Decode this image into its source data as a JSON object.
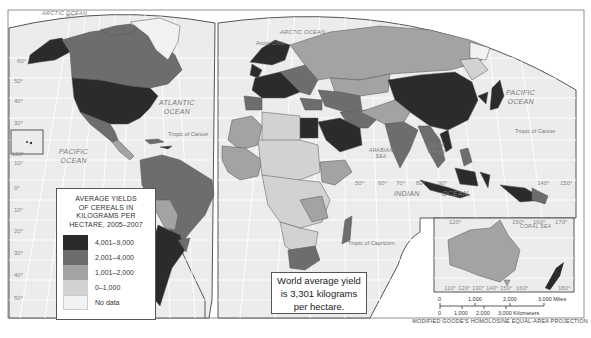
{
  "map": {
    "title": "Average Yields of Cereals in Kilograms per Hectare, 2005–2007",
    "projection_label": "MODIFIED GOODE'S HOMOLOSINE EQUAL-AREA PROJECTION",
    "colors": {
      "ocean": "#eeeeee",
      "graticule": "#ffffff",
      "border": "#555555",
      "class_4001_9000": "#2b2b2b",
      "class_2001_4000": "#6d6d6d",
      "class_1001_2000": "#a3a3a3",
      "class_0_1000": "#d2d2d2",
      "class_no_data": "#f2f2f2"
    },
    "legend": {
      "title": "AVERAGE YIELDS OF CEREALS IN KILOGRAMS PER HECTARE, 2005–2007",
      "title_lines": [
        "AVERAGE YIELDS",
        "OF CEREALS IN",
        "KILOGRAMS PER",
        "HECTARE, 2005–2007"
      ],
      "items": [
        {
          "label": "4,001–9,000",
          "color": "#2b2b2b"
        },
        {
          "label": "2,001–4,000",
          "color": "#6d6d6d"
        },
        {
          "label": "1,001–2,000",
          "color": "#a3a3a3"
        },
        {
          "label": "0–1,000",
          "color": "#d2d2d2"
        },
        {
          "label": "No data",
          "color": "#f2f2f2"
        }
      ]
    },
    "annotation": {
      "lines": [
        "World average yield",
        "is 3,301 kilograms",
        "per hectare."
      ]
    },
    "oceans": {
      "arctic_west": "ARCTIC OCEAN",
      "arctic_east": "ARCTIC OCEAN",
      "atlantic": [
        "ATLANTIC",
        "OCEAN"
      ],
      "pacific_west": [
        "PACIFIC",
        "OCEAN"
      ],
      "pacific_east": [
        "PACIFIC",
        "OCEAN"
      ],
      "indian": [
        "INDIAN",
        "OCEAN"
      ],
      "arabian_sea": [
        "ARABIAN",
        "SEA"
      ],
      "bay_of_bengal": [
        "Bay of",
        "Bengal"
      ],
      "coral_sea": "CORAL SEA"
    },
    "lines": {
      "arctic_circle": "Arctic Circle",
      "tropic_cancer": "Tropic of Cancer",
      "tropic_capricorn": "Tropic of Capricorn"
    },
    "scale": {
      "miles": [
        "0",
        "1,000",
        "2,000",
        "3,000 Miles"
      ],
      "kilometers": [
        "0",
        "1,000",
        "2,000",
        "3,000 Kilometers"
      ]
    },
    "degree_labels": {
      "west_lat": [
        "60°",
        "50°",
        "40°",
        "30°",
        "20°",
        "10°",
        "0°",
        "10°",
        "20°",
        "30°",
        "40°",
        "50°"
      ],
      "top": "80°",
      "hawaii": "160°",
      "indian_lon": [
        "50°",
        "60°",
        "70°",
        "80°",
        "90°"
      ],
      "pacific_lon": [
        "140°",
        "150°"
      ],
      "aus_lon": [
        "110°",
        "120°",
        "130°",
        "140°",
        "150°",
        "160°",
        "180°"
      ],
      "aus_top": [
        "120°",
        "150°",
        "160°",
        "170°"
      ]
    }
  }
}
